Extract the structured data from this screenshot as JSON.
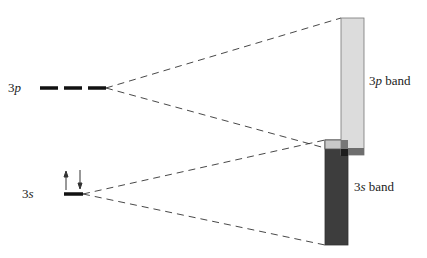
{
  "levels": {
    "p": {
      "label_num": "3",
      "label_orb": "p"
    },
    "s": {
      "label_num": "3",
      "label_orb": "s"
    }
  },
  "bands": {
    "p": {
      "label_num": "3",
      "label_orb": "p",
      "label_suffix": " band",
      "color": "#d9d9d9"
    },
    "s": {
      "label_num": "3",
      "label_orb": "s",
      "label_suffix": " band",
      "color": "#3a3a3a"
    }
  },
  "electrons": {
    "up": "spin-up",
    "down": "spin-down"
  }
}
